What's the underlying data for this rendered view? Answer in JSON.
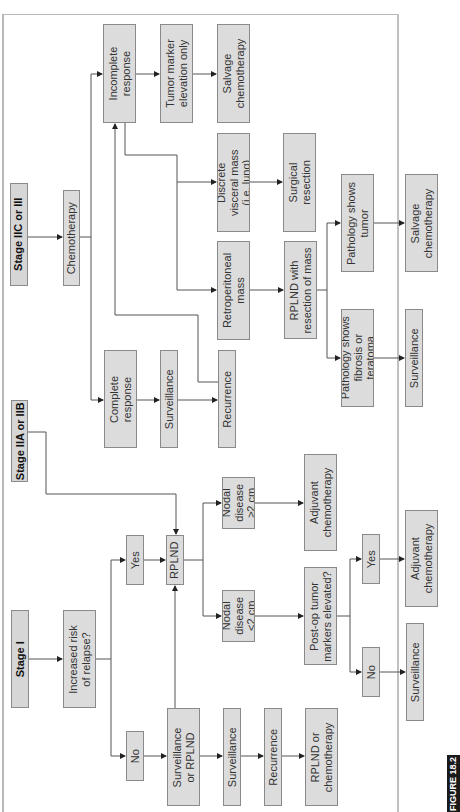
{
  "figure_label": "FIGURE 18.2",
  "orientation": "rotated 90 degrees counter-clockwise",
  "colors": {
    "box_fill": "#dcdcdc",
    "box_border": "#8a8a8a",
    "line": "#444444",
    "label_bg": "#1a1a1a"
  },
  "stages": {
    "stage_iic_iii": "Stage IIC or III",
    "stage_iia_iib": "Stage IIA or IIB",
    "stage_i": "Stage I"
  },
  "nodes": {
    "chemotherapy": "Chemotherapy",
    "incomplete_response": "Incomplete\nresponse",
    "tumor_marker_elevation": "Tumor marker\nelevation only",
    "salvage_chemo_1": "Salvage\nchemotherapy",
    "discrete_visceral_mass": "Discrete\nvisceral mass\n(i.e. lung)",
    "surgical_resection": "Surgical\nresection",
    "retroperitoneal_mass": "Retroperitoneal\nmass",
    "rplnd_with_resection": "RPLND with\nresection of mass",
    "pathology_tumor": "Pathology shows\ntumor",
    "salvage_chemo_2": "Salvage\nchemotherapy",
    "pathology_fibrosis": "Pathology shows\nfibrosis or\nteratoma",
    "surveillance_after_fibrosis": "Surveillance",
    "complete_response": "Complete\nresponse",
    "surveillance_after_complete": "Surveillance",
    "recurrence_after_complete": "Recurrence",
    "increased_risk": "Increased risk\nof relapse?",
    "yes_risk": "Yes",
    "rplnd": "RPLND",
    "nodal_ge2": "Nodal\ndisease\n≥2 cm",
    "nodal_lt2": "Nodal\ndisease\n<2 cm",
    "adjuvant_chemo_1": "Adjuvant\nchemotherapy",
    "postop_markers": "Post-op tumor\nmarkers elevated?",
    "yes_markers": "Yes",
    "no_markers": "No",
    "adjuvant_chemo_2": "Adjuvant\nchemotherapy",
    "surveillance_after_no_markers": "Surveillance",
    "no_risk": "No",
    "surveillance_or_rplnd": "Surveillance\nor RPLND",
    "surveillance_stage_i": "Surveillance",
    "recurrence_stage_i": "Recurrence",
    "rplnd_or_chemo": "RPLND or\nchemotherapy"
  }
}
